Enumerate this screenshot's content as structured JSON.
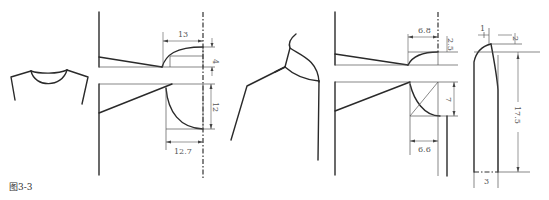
{
  "figure": {
    "caption": "图3-3"
  },
  "panels": {
    "front_neck_sketch": {
      "description": "front view of crew neckline garment"
    },
    "round_neck_pattern": {
      "dimensions": {
        "width_top": "13",
        "drop_top": "4",
        "depth_bottom": "12",
        "width_bottom": "12.7"
      }
    },
    "side_collar_sketch": {
      "description": "side view of stand collar on shoulder"
    },
    "collar_pattern": {
      "dimensions": {
        "width_top": "6.8",
        "drop_top": "2.5",
        "depth_bottom": "7",
        "width_bottom": "6.6"
      }
    },
    "collar_piece": {
      "dimensions": {
        "top_offset_left": "1",
        "top_rise_right": "2",
        "length": "17.5",
        "bottom_width": "3"
      }
    }
  }
}
